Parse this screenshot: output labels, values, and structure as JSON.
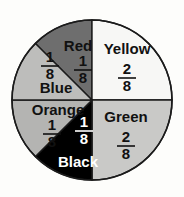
{
  "chart_data": {
    "type": "pie",
    "title": "",
    "xlabel": "",
    "ylabel": "",
    "total_parts": 8,
    "legend_position": "in-slice",
    "grid": false,
    "categories": [
      "Red",
      "Yellow",
      "Green",
      "Black",
      "Orange",
      "Blue"
    ],
    "values": [
      1,
      2,
      2,
      1,
      1,
      1
    ],
    "labels": [
      "1/8",
      "2/8",
      "2/8",
      "1/8",
      "1/8",
      "1/8"
    ],
    "colors": [
      "#6e6e6e",
      "#f7f7f5",
      "#c9c9c7",
      "#000000",
      "#b4b4b2",
      "#bdbdbb"
    ],
    "slices": [
      {
        "name": "red",
        "label": "Red",
        "numerator": "1",
        "denominator": "8",
        "fraction": "1/8",
        "value": 1,
        "color": "#6e6e6e",
        "text_color": "dark",
        "start_angle": 315,
        "end_angle": 360,
        "label_x": 78,
        "label_y": 47,
        "frac_x": 83,
        "frac_y": 70
      },
      {
        "name": "yellow",
        "label": "Yellow",
        "numerator": "2",
        "denominator": "8",
        "fraction": "2/8",
        "value": 2,
        "color": "#f7f7f5",
        "text_color": "dark",
        "start_angle": 0,
        "end_angle": 90,
        "label_x": 127,
        "label_y": 50,
        "frac_x": 127,
        "frac_y": 78
      },
      {
        "name": "green",
        "label": "Green",
        "numerator": "2",
        "denominator": "8",
        "fraction": "2/8",
        "value": 2,
        "color": "#c9c9c7",
        "text_color": "dark",
        "start_angle": 90,
        "end_angle": 180,
        "label_x": 126,
        "label_y": 118,
        "frac_x": 126,
        "frac_y": 146
      },
      {
        "name": "black",
        "label": "Black",
        "numerator": "1",
        "denominator": "8",
        "fraction": "1/8",
        "value": 1,
        "color": "#000000",
        "text_color": "light",
        "start_angle": 180,
        "end_angle": 225,
        "label_x": 78,
        "label_y": 163,
        "frac_x": 84,
        "frac_y": 131
      },
      {
        "name": "orange",
        "label": "Orange",
        "numerator": "1",
        "denominator": "8",
        "fraction": "1/8",
        "value": 1,
        "color": "#b4b4b2",
        "text_color": "dark",
        "start_angle": 225,
        "end_angle": 270,
        "label_x": 58,
        "label_y": 111,
        "frac_x": 52,
        "frac_y": 134
      },
      {
        "name": "blue",
        "label": "Blue",
        "numerator": "1",
        "denominator": "8",
        "fraction": "1/8",
        "value": 1,
        "color": "#bdbdbb",
        "text_color": "dark",
        "start_angle": 270,
        "end_angle": 315,
        "label_x": 56,
        "label_y": 89,
        "frac_x": 50,
        "frac_y": 66
      }
    ],
    "geometry": {
      "center_x": 92,
      "center_y": 100,
      "radius": 80
    },
    "background_color": "#fdfdfb",
    "outline_color": "#1b1b1b"
  }
}
